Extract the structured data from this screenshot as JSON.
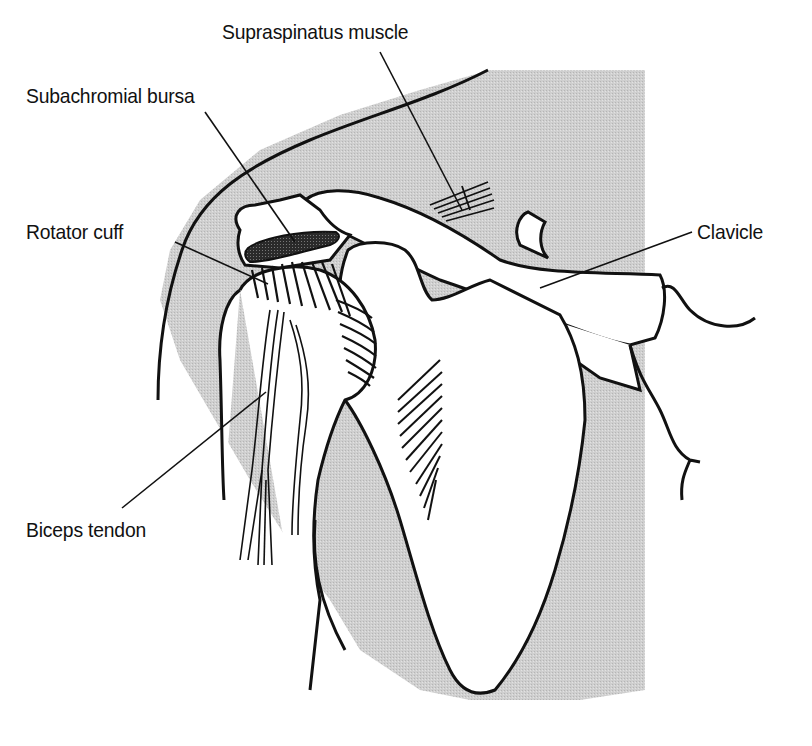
{
  "diagram": {
    "background_color": "#ffffff",
    "shade_color": "#d4d4d4",
    "line_color": "#111111",
    "labels": [
      {
        "id": "supraspinatus",
        "text": "Supraspinatus muscle",
        "x": 222,
        "y": 20
      },
      {
        "id": "bursa",
        "text": "Subachromial bursa",
        "x": 26,
        "y": 84
      },
      {
        "id": "rotator",
        "text": "Rotator cuff",
        "x": 26,
        "y": 220
      },
      {
        "id": "clavicle",
        "text": "Clavicle",
        "x": 697,
        "y": 220
      },
      {
        "id": "biceps",
        "text": "Biceps tendon",
        "x": 26,
        "y": 518
      }
    ]
  }
}
